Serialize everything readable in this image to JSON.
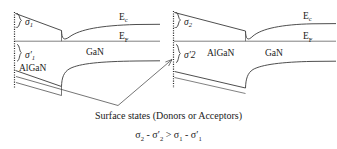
{
  "figure": {
    "title_absent": true,
    "left_panel": {
      "name": "low-surface-charge-band-diagram",
      "sigma_top_label": "σ",
      "sigma_top_sub": "1",
      "sigma_bottom_label": "σ′",
      "sigma_bottom_sub": "1",
      "barrier_material": "AlGaN",
      "channel_material": "GaN",
      "conduction_band_label": "E",
      "conduction_band_sub": "c",
      "fermi_level_label": "E",
      "fermi_level_sub": "F",
      "surface_marker": "hatched-surface"
    },
    "right_panel": {
      "name": "high-surface-charge-band-diagram",
      "sigma_top_label": "σ",
      "sigma_top_sub": "2",
      "sigma_bottom_label": "σ′2",
      "sigma_bottom_sub": "",
      "barrier_material": "AlGaN",
      "channel_material": "GaN",
      "conduction_band_label": "E",
      "conduction_band_sub": "c",
      "fermi_level_label": "E",
      "fermi_level_sub": "F",
      "surface_marker": "hatched-surface"
    },
    "caption": {
      "line1": "Surface states (Donors or Acceptors)",
      "formula_parts": {
        "s2": "σ",
        "s2_sub": "2",
        "minus1": "-",
        "s2p": "σ′",
        "s2p_sub": "2",
        "gt": ">",
        "s1": "σ",
        "s1_sub": "1",
        "minus2": "-",
        "s1p": "σ′",
        "s1p_sub": "1"
      },
      "formula_plain": "σ₂ - σ′2 > σ₁ - σ′1"
    },
    "colors": {
      "line": "#3a3a3a",
      "text": "#1a1a1a",
      "background": "#ffffff"
    }
  }
}
